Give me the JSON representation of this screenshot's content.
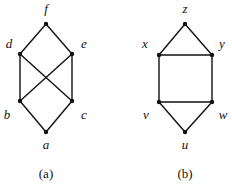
{
  "graphs": [
    {
      "caption": "(a)",
      "caption_pos": [
        46,
        178
      ],
      "nodes": [
        {
          "id": "f",
          "label": "f",
          "pos": [
            46,
            24
          ],
          "label_pos": [
            46,
            13
          ]
        },
        {
          "id": "d",
          "label": "d",
          "pos": [
            20,
            54
          ],
          "label_pos": [
            9,
            48
          ]
        },
        {
          "id": "e",
          "label": "e",
          "pos": [
            72,
            54
          ],
          "label_pos": [
            84,
            48
          ]
        },
        {
          "id": "b",
          "label": "b",
          "pos": [
            20,
            101
          ],
          "label_pos": [
            7,
            119
          ]
        },
        {
          "id": "c",
          "label": "c",
          "pos": [
            72,
            101
          ],
          "label_pos": [
            84,
            119
          ]
        },
        {
          "id": "a",
          "label": "a",
          "pos": [
            46,
            132
          ],
          "label_pos": [
            46,
            149
          ]
        }
      ],
      "edges": [
        [
          "f",
          "d"
        ],
        [
          "f",
          "e"
        ],
        [
          "d",
          "b"
        ],
        [
          "d",
          "c"
        ],
        [
          "e",
          "b"
        ],
        [
          "e",
          "c"
        ],
        [
          "b",
          "a"
        ],
        [
          "c",
          "a"
        ]
      ]
    },
    {
      "caption": "(b)",
      "caption_pos": [
        185,
        178
      ],
      "nodes": [
        {
          "id": "z",
          "label": "z",
          "pos": [
            185,
            24
          ],
          "label_pos": [
            185,
            13
          ]
        },
        {
          "id": "x",
          "label": "x",
          "pos": [
            159,
            55
          ],
          "label_pos": [
            145,
            48
          ]
        },
        {
          "id": "y",
          "label": "y",
          "pos": [
            212,
            55
          ],
          "label_pos": [
            222,
            48
          ]
        },
        {
          "id": "v",
          "label": "v",
          "pos": [
            159,
            102
          ],
          "label_pos": [
            146,
            119
          ]
        },
        {
          "id": "w",
          "label": "w",
          "pos": [
            212,
            102
          ],
          "label_pos": [
            223,
            119
          ]
        },
        {
          "id": "u",
          "label": "u",
          "pos": [
            185,
            132
          ],
          "label_pos": [
            185,
            149
          ]
        }
      ],
      "edges": [
        [
          "z",
          "x"
        ],
        [
          "z",
          "y"
        ],
        [
          "x",
          "y"
        ],
        [
          "x",
          "v"
        ],
        [
          "y",
          "w"
        ],
        [
          "v",
          "w"
        ],
        [
          "v",
          "u"
        ],
        [
          "w",
          "u"
        ]
      ]
    }
  ],
  "colors": {
    "ink": "#111111",
    "background": "#ffffff"
  }
}
